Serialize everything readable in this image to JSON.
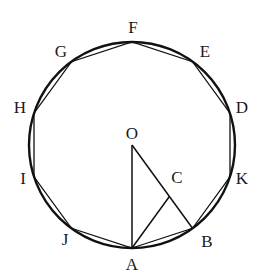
{
  "diagram": {
    "type": "regular decagon inscribed in circle",
    "center": {
      "label": "O",
      "x": 132,
      "y": 145
    },
    "radius": 103,
    "stroke_color": "#111111",
    "vertices": [
      {
        "label": "A",
        "x": 132.0,
        "y": 248.0,
        "lx": 132,
        "ly": 270
      },
      {
        "label": "B",
        "x": 192.5,
        "y": 228.3,
        "lx": 207,
        "ly": 247
      },
      {
        "label": "K",
        "x": 230.0,
        "y": 176.8,
        "lx": 242,
        "ly": 184
      },
      {
        "label": "D",
        "x": 230.0,
        "y": 113.2,
        "lx": 242,
        "ly": 113
      },
      {
        "label": "E",
        "x": 192.5,
        "y": 61.7,
        "lx": 205,
        "ly": 57
      },
      {
        "label": "F",
        "x": 132.0,
        "y": 42.0,
        "lx": 133,
        "ly": 33
      },
      {
        "label": "G",
        "x": 71.5,
        "y": 61.7,
        "lx": 61,
        "ly": 57
      },
      {
        "label": "H",
        "x": 34.0,
        "y": 113.2,
        "lx": 20,
        "ly": 113
      },
      {
        "label": "I",
        "x": 34.0,
        "y": 176.8,
        "lx": 23,
        "ly": 184
      },
      {
        "label": "J",
        "x": 71.5,
        "y": 228.3,
        "lx": 65,
        "ly": 245
      }
    ],
    "point_C": {
      "label": "C",
      "x": 169.4,
      "y": 196.5,
      "lx": 177,
      "ly": 183
    },
    "segments": [
      [
        "O",
        "A"
      ],
      [
        "O",
        "B"
      ],
      [
        "A",
        "C"
      ]
    ],
    "labels": {
      "O": "O",
      "A": "A",
      "B": "B",
      "C": "C",
      "D": "D",
      "E": "E",
      "F": "F",
      "G": "G",
      "H": "H",
      "I": "I",
      "J": "J",
      "K": "K"
    }
  }
}
